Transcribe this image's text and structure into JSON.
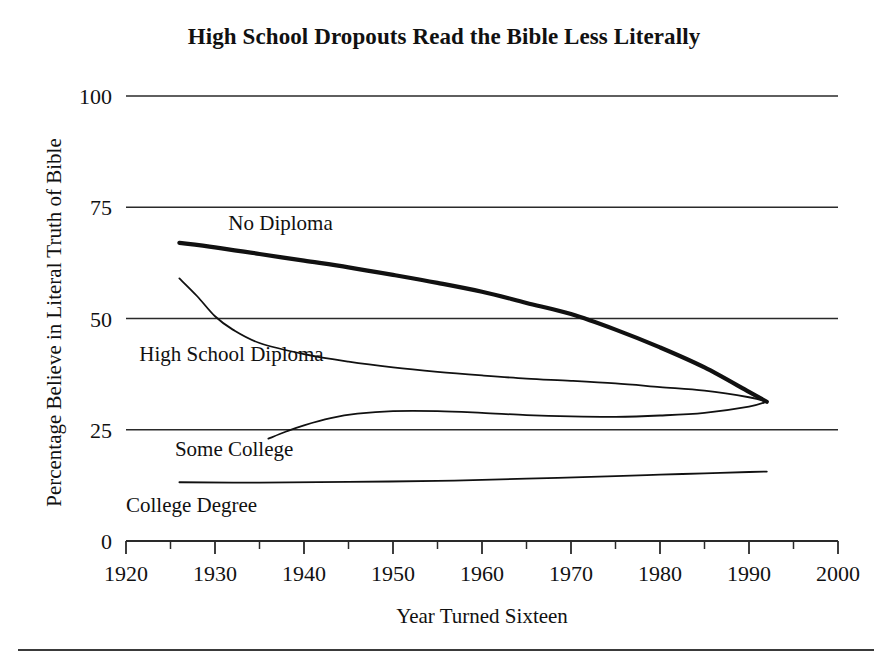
{
  "chart_data": {
    "type": "line",
    "title": "High School Dropouts Read the Bible Less Literally",
    "subtitle": "",
    "xlabel": "Year Turned Sixteen",
    "ylabel": "Percentage Believe in Literal Truth of Bible",
    "xlim": [
      1920,
      2000
    ],
    "ylim": [
      0,
      100
    ],
    "grid": "horizontal",
    "legend_position": "inline-labels",
    "xticks": [
      1920,
      1930,
      1940,
      1950,
      1960,
      1970,
      1980,
      1990,
      2000
    ],
    "xticks_minor": [
      1925,
      1935,
      1945,
      1955,
      1965,
      1975,
      1985,
      1995
    ],
    "yticks": [
      0,
      25,
      50,
      75,
      100
    ],
    "series": [
      {
        "name": "No Diploma",
        "label": "No Diploma",
        "emphasis": "bold",
        "linewidth": 4.2,
        "x": [
          1926,
          1930,
          1935,
          1940,
          1945,
          1950,
          1955,
          1960,
          1965,
          1970,
          1975,
          1980,
          1985,
          1990,
          1992
        ],
        "values": [
          67.0,
          66.0,
          64.5,
          63.0,
          61.5,
          59.8,
          58.0,
          56.0,
          53.5,
          51.0,
          47.5,
          43.5,
          39.0,
          33.5,
          31.3
        ]
      },
      {
        "name": "High School Diploma",
        "label": "High School Diploma",
        "emphasis": "normal",
        "linewidth": 1.8,
        "x": [
          1926,
          1928,
          1930,
          1932,
          1935,
          1940,
          1945,
          1950,
          1955,
          1960,
          1965,
          1970,
          1975,
          1980,
          1985,
          1990,
          1992
        ],
        "values": [
          59.0,
          55.0,
          50.5,
          47.5,
          44.5,
          42.0,
          40.3,
          39.0,
          38.0,
          37.2,
          36.5,
          36.0,
          35.4,
          34.6,
          33.8,
          32.3,
          31.3
        ]
      },
      {
        "name": "Some College",
        "label": "Some College",
        "emphasis": "normal",
        "linewidth": 1.8,
        "x": [
          1936,
          1938,
          1940,
          1943,
          1946,
          1950,
          1955,
          1960,
          1965,
          1970,
          1975,
          1980,
          1985,
          1990,
          1992
        ],
        "values": [
          23.0,
          24.6,
          26.0,
          27.6,
          28.6,
          29.2,
          29.2,
          28.8,
          28.3,
          28.0,
          27.9,
          28.2,
          28.8,
          30.2,
          31.3
        ]
      },
      {
        "name": "College Degree",
        "label": "College Degree",
        "emphasis": "normal",
        "linewidth": 1.8,
        "x": [
          1926,
          1935,
          1945,
          1955,
          1965,
          1975,
          1980,
          1985,
          1990,
          1992
        ],
        "values": [
          13.2,
          13.1,
          13.3,
          13.5,
          14.0,
          14.6,
          14.9,
          15.2,
          15.5,
          15.6
        ]
      }
    ],
    "annotations": [
      {
        "text": "No Diploma",
        "x": 1931.5,
        "y": 70.0
      },
      {
        "text": "High School Diploma",
        "x": 1921.5,
        "y": 40.5
      },
      {
        "text": "Some College",
        "x": 1925.5,
        "y": 19.0
      },
      {
        "text": "College Degree",
        "x": 1920.0,
        "y": 6.5
      }
    ],
    "colors": {
      "line": "#111111",
      "grid": "#2a2a2a",
      "background": "#ffffff",
      "text": "#111111"
    }
  }
}
